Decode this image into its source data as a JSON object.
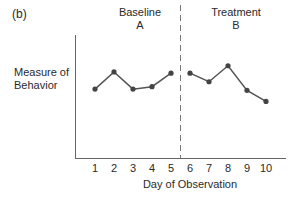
{
  "chart_data": {
    "type": "line",
    "panel_label": "(b)",
    "title": "",
    "xlabel": "Day of Observation",
    "ylabel": "Measure of Behavior",
    "ylabel_lines": [
      "Measure of",
      "Behavior"
    ],
    "x": [
      1,
      2,
      3,
      4,
      5,
      6,
      7,
      8,
      9,
      10
    ],
    "x_tick_labels": [
      "1",
      "2",
      "3",
      "4",
      "5",
      "6",
      "7",
      "8",
      "9",
      "10"
    ],
    "phases": [
      {
        "name": "Baseline",
        "code": "A",
        "days": [
          1,
          2,
          3,
          4,
          5
        ]
      },
      {
        "name": "Treatment",
        "code": "B",
        "days": [
          6,
          7,
          8,
          9,
          10
        ]
      }
    ],
    "phase_change_after_day": 5,
    "series": [
      {
        "name": "Baseline A",
        "x": [
          1,
          2,
          3,
          4,
          5
        ],
        "values": [
          5.6,
          7.0,
          5.6,
          5.8,
          6.9
        ]
      },
      {
        "name": "Treatment B",
        "x": [
          6,
          7,
          8,
          9,
          10
        ],
        "values": [
          6.9,
          6.2,
          7.5,
          5.5,
          4.6
        ]
      }
    ],
    "ylim": [
      0,
      10
    ],
    "y_ticks": false,
    "grid": false,
    "legend": "none",
    "colors": {
      "line": "#555555",
      "marker": "#444444",
      "axis": "#666666",
      "divider": "#777777"
    }
  },
  "labels": {
    "panel": "(b)",
    "phase_a_name": "Baseline",
    "phase_a_code": "A",
    "phase_b_name": "Treatment",
    "phase_b_code": "B",
    "ylabel_line1": "Measure of",
    "ylabel_line2": "Behavior",
    "xlabel": "Day of Observation"
  }
}
